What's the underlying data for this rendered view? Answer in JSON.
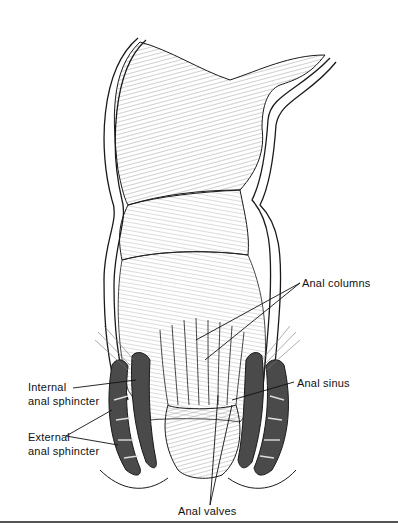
{
  "figure": {
    "colors": {
      "line": "#1a1a1a",
      "hatch": "#555555",
      "muscle": "#4a4a4a",
      "background": "#ffffff"
    }
  },
  "labels": {
    "internal_sphincter": {
      "line1": "Internal",
      "line2": "anal sphincter"
    },
    "external_sphincter": {
      "line1": "External",
      "line2": "anal sphincter"
    },
    "anal_columns": "Anal columns",
    "anal_sinus": "Anal sinus",
    "anal_valves": "Anal valves"
  }
}
